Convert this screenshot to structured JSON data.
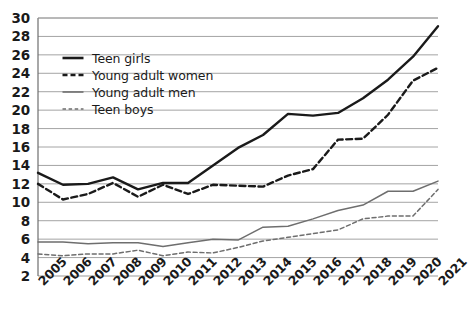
{
  "chart_data": {
    "type": "line",
    "title": "",
    "subtitle": "",
    "xlabel": "",
    "ylabel": "",
    "grid": true,
    "legend_position": "upper-left-inside",
    "categories": [
      "2005",
      "2006",
      "2007",
      "2008",
      "2009",
      "2010",
      "2011",
      "2012",
      "2013",
      "2014",
      "2015",
      "2016",
      "2017",
      "2018",
      "2019",
      "2020",
      "2021"
    ],
    "x": [
      2005,
      2006,
      2007,
      2008,
      2009,
      2010,
      2011,
      2012,
      2013,
      2014,
      2015,
      2016,
      2017,
      2018,
      2019,
      2020,
      2021
    ],
    "xlim": [
      2005,
      2021
    ],
    "ylim": [
      2,
      30
    ],
    "ytick_labels": [
      "30",
      "28",
      "26",
      "24",
      "22",
      "20",
      "18",
      "16",
      "14",
      "12",
      "10",
      "8",
      "6",
      "4",
      "2"
    ],
    "ytick_values": [
      30,
      28,
      26,
      24,
      22,
      20,
      18,
      16,
      14,
      12,
      10,
      8,
      6,
      4,
      2
    ],
    "series": [
      {
        "name": "Teen girls",
        "style": "solid",
        "width": "thick",
        "color": "#1a1a1a",
        "values": [
          13.2,
          11.9,
          12.0,
          12.7,
          11.4,
          12.1,
          12.1,
          14.0,
          15.9,
          17.3,
          19.6,
          19.4,
          19.7,
          21.3,
          23.3,
          25.8,
          29.1
        ]
      },
      {
        "name": "Young adult women",
        "style": "dashed",
        "width": "thick",
        "color": "#1a1a1a",
        "values": [
          12.0,
          10.3,
          10.9,
          12.1,
          10.6,
          11.9,
          10.9,
          11.9,
          11.8,
          11.7,
          12.9,
          13.6,
          16.8,
          16.9,
          19.5,
          23.2,
          24.6
        ]
      },
      {
        "name": "Young adult men",
        "style": "solid",
        "width": "thin",
        "color": "#6e6e6e",
        "values": [
          5.7,
          5.7,
          5.5,
          5.6,
          5.6,
          5.2,
          5.6,
          6.0,
          5.9,
          7.3,
          7.4,
          8.2,
          9.1,
          9.7,
          11.2,
          11.2,
          12.3
        ]
      },
      {
        "name": "Teen boys",
        "style": "dashed",
        "width": "thin",
        "color": "#6e6e6e",
        "values": [
          4.4,
          4.2,
          4.4,
          4.4,
          4.8,
          4.2,
          4.6,
          4.5,
          5.1,
          5.8,
          6.2,
          6.6,
          7.0,
          8.2,
          8.5,
          8.5,
          11.4
        ]
      }
    ]
  },
  "legend": {
    "items": [
      {
        "label": "Teen girls"
      },
      {
        "label": "Young adult women"
      },
      {
        "label": "Young adult men"
      },
      {
        "label": "Teen boys"
      }
    ]
  },
  "colors": {
    "axis": "#6e6e6e",
    "grid": "#9a9a9a",
    "text": "#1a1a1a",
    "series_dark": "#1a1a1a",
    "series_gray": "#6e6e6e",
    "background": "#ffffff"
  }
}
